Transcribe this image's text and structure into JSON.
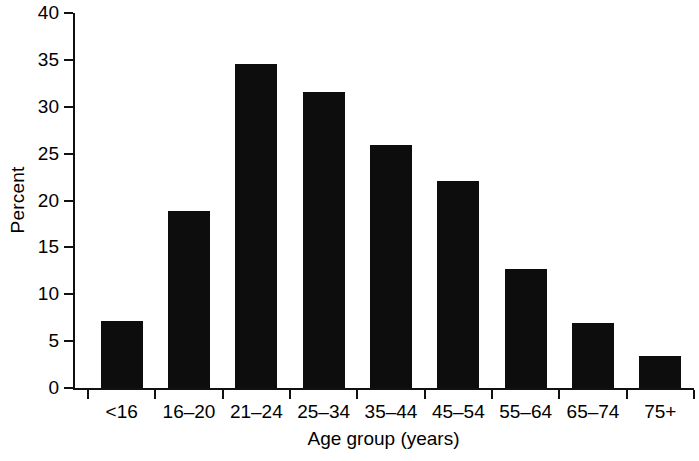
{
  "chart_data": {
    "type": "bar",
    "title": "",
    "subtitle": "",
    "xlabel": "Age group (years)",
    "ylabel": "Percent",
    "categories": [
      "<16",
      "16–20",
      "21–24",
      "25–34",
      "35–44",
      "45–54",
      "55–64",
      "65–74",
      "75+"
    ],
    "values": [
      7.2,
      18.9,
      34.6,
      31.6,
      25.9,
      22.1,
      12.7,
      6.9,
      3.4
    ],
    "series": [
      {
        "name": "Percent",
        "values": [
          7.2,
          18.9,
          34.6,
          31.6,
          25.9,
          22.1,
          12.7,
          6.9,
          3.4
        ]
      }
    ],
    "ylim": [
      0,
      40
    ],
    "yticks": [
      0,
      5,
      10,
      15,
      20,
      25,
      30,
      35,
      40
    ],
    "ytick_labels": [
      "0",
      "5",
      "10",
      "15",
      "20",
      "25",
      "30",
      "35",
      "40"
    ],
    "grid": false,
    "legend": null,
    "legend_position": "none",
    "bar_color": "#0d0d0d",
    "background_color": "#ffffff",
    "axis_color": "#111111",
    "annotations": []
  }
}
